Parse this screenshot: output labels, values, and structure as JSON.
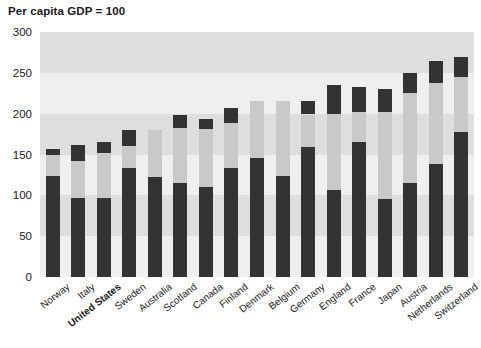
{
  "chart": {
    "title": "Per capita GDP = 100",
    "ylabel": "",
    "xlabel": ""
  },
  "axis": {
    "ticks": [
      "300",
      "250",
      "200",
      "150",
      "100",
      "50",
      "0"
    ]
  },
  "colors": {
    "dark": "#333333",
    "mid": "#8e8e8e",
    "light": "#c9c9c9",
    "plot_bg": "#e8e8e8",
    "band_light": "#efefef",
    "band_dark": "#dedede",
    "text": "#1a1a1a"
  },
  "chart_data": {
    "type": "bar",
    "title": "Per capita GDP = 100",
    "xlabel": "",
    "ylabel": "Per capita GDP = 100",
    "ylim": [
      0,
      300
    ],
    "yticks": [
      0,
      50,
      100,
      150,
      200,
      250,
      300
    ],
    "grid": true,
    "stacked": true,
    "legend": "none",
    "categories": [
      "Norway",
      "Italy",
      "United States",
      "Sweden",
      "Australia",
      "Scotland",
      "Canada",
      "Finland",
      "Denmark",
      "Belgium",
      "Germany",
      "England",
      "France",
      "Japan",
      "Austria",
      "Netherlands",
      "Switzerland"
    ],
    "highlighted_category": "United States",
    "series": [
      {
        "name": "bottom",
        "values": [
          124,
          97,
          97,
          134,
          123,
          115,
          110,
          134,
          146,
          124,
          159,
          107,
          165,
          95,
          115,
          138,
          178
        ]
      },
      {
        "name": "middle",
        "values": [
          26,
          45,
          55,
          26,
          57,
          68,
          71,
          55,
          69,
          91,
          40,
          93,
          37,
          107,
          110,
          99,
          67
        ]
      },
      {
        "name": "top",
        "values": [
          7,
          20,
          13,
          20,
          0,
          15,
          13,
          18,
          0,
          0,
          16,
          35,
          31,
          28,
          25,
          28,
          25
        ]
      }
    ],
    "totals": [
      157,
      162,
      165,
      180,
      180,
      198,
      194,
      207,
      215,
      215,
      215,
      235,
      233,
      230,
      250,
      265,
      270
    ]
  },
  "labels": [
    {
      "text": "Norway",
      "bold": false
    },
    {
      "text": "Italy",
      "bold": false
    },
    {
      "text": "United States",
      "bold": true
    },
    {
      "text": "Sweden",
      "bold": false
    },
    {
      "text": "Australia",
      "bold": false
    },
    {
      "text": "Scotland",
      "bold": false
    },
    {
      "text": "Canada",
      "bold": false
    },
    {
      "text": "Finland",
      "bold": false
    },
    {
      "text": "Denmark",
      "bold": false
    },
    {
      "text": "Belgium",
      "bold": false
    },
    {
      "text": "Germany",
      "bold": false
    },
    {
      "text": "England",
      "bold": false
    },
    {
      "text": "France",
      "bold": false
    },
    {
      "text": "Japan",
      "bold": false
    },
    {
      "text": "Austria",
      "bold": false
    },
    {
      "text": "Netherlands",
      "bold": false
    },
    {
      "text": "Switzerland",
      "bold": false
    }
  ]
}
